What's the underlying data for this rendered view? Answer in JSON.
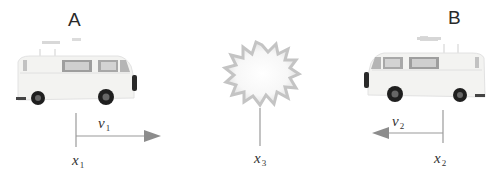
{
  "diagram": {
    "vehicle_a": {
      "label": "A",
      "direction": "right"
    },
    "vehicle_b": {
      "label": "B",
      "direction": "left"
    },
    "velocity_a": {
      "symbol": "v",
      "subscript": "1"
    },
    "velocity_b": {
      "symbol": "v",
      "subscript": "2"
    },
    "position_a": {
      "symbol": "x",
      "subscript": "1"
    },
    "position_b": {
      "symbol": "x",
      "subscript": "2"
    },
    "collision_point": {
      "symbol": "x",
      "subscript": "3",
      "icon": "explosion-burst-icon"
    },
    "colors": {
      "arrow": "#8c8c8c",
      "line": "#9a9a9a",
      "burst": "#c8c8c8",
      "van_body": "#f3f3f1",
      "tire": "#222222"
    }
  }
}
